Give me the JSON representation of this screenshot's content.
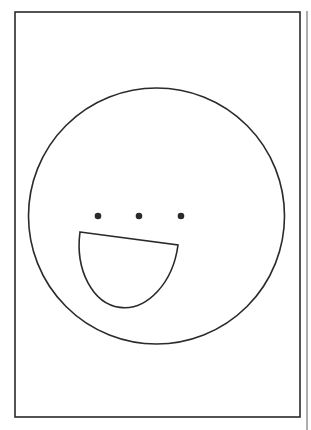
{
  "drawing": {
    "background": "#ffffff",
    "stroke_color": "#2a2a2a",
    "side_line_color": "#8a8a8a",
    "frame": {
      "x": 15,
      "y": 12,
      "width": 285,
      "height": 405
    },
    "side_line": {
      "x": 307,
      "y1": 11,
      "y2": 430
    },
    "face": {
      "cx": 156.5,
      "cy": 216,
      "r": 128
    },
    "eyes": [
      {
        "cx": 98,
        "cy": 216,
        "r": 3.3
      },
      {
        "cx": 139,
        "cy": 216,
        "r": 3.3
      },
      {
        "cx": 181,
        "cy": 216,
        "r": 3.3
      }
    ],
    "mouth": {
      "left": {
        "x": 80,
        "y": 232
      },
      "right": {
        "x": 178,
        "y": 245
      },
      "bottom_y": 308
    }
  }
}
